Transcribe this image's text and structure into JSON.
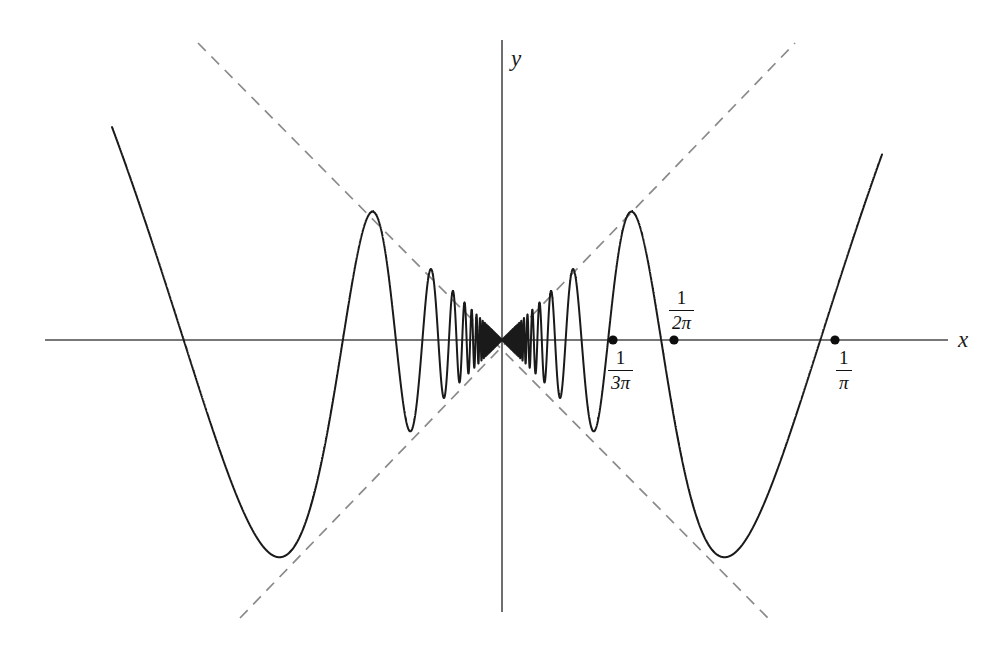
{
  "figure": {
    "title": "",
    "background_color": "#ffffff",
    "curve_color": "#1a1a1a",
    "envelope_color": "#8a8a8a",
    "axis_color": "#4a4a4a"
  },
  "axes": {
    "x_label": "x",
    "y_label": "y",
    "x_axis_pixel_y": 340,
    "y_axis_pixel_x": 502,
    "x_axis_start_px": 45,
    "x_axis_end_px": 948,
    "y_axis_top_px": 40,
    "y_axis_bottom_px": 612
  },
  "marked_roots": [
    {
      "label_num": "1",
      "label_den": "3π",
      "pixel_x": 613,
      "has_dot": true
    },
    {
      "label_num": "1",
      "label_den": "2π",
      "pixel_x": 674,
      "has_dot": true
    },
    {
      "label_num": "1",
      "label_den": "π",
      "pixel_x": 835,
      "has_dot": true
    }
  ],
  "chart_data": {
    "type": "line",
    "title": "",
    "xlabel": "x",
    "ylabel": "y",
    "function": "y = x sin(1/x)",
    "envelope_functions": [
      "y = x",
      "y = -x"
    ],
    "grid": false,
    "legend": false,
    "xlim": [
      -0.48,
      0.48
    ],
    "ylim": [
      -0.48,
      0.48
    ],
    "x_domain_drawn": [
      -0.39,
      0.38
    ],
    "annotations": [
      {
        "text": "1/(3π)",
        "x": 0.106,
        "y": 0
      },
      {
        "text": "1/(2π)",
        "x": 0.159,
        "y": 0
      },
      {
        "text": "1/π",
        "x": 0.318,
        "y": 0
      }
    ],
    "zero_crossings": [
      -0.318,
      -0.159,
      -0.106,
      -0.0796,
      -0.0637,
      -0.0531,
      -0.0455,
      -0.0398,
      -0.0354,
      -0.0318,
      -0.0289,
      -0.0265,
      -0.0245,
      -0.0227,
      -0.0212,
      -0.0199,
      0.0199,
      0.0212,
      0.0227,
      0.0245,
      0.0265,
      0.0289,
      0.0318,
      0.0354,
      0.0398,
      0.0455,
      0.0531,
      0.0637,
      0.0796,
      0.106,
      0.159,
      0.318
    ],
    "extrema_touching_envelope": [
      {
        "x": -0.2225,
        "y": 0.2225,
        "type": "max"
      },
      {
        "x": -0.1273,
        "y": -0.1273,
        "type": "min"
      },
      {
        "x": 0.1273,
        "y": 0.1273,
        "type": "max"
      },
      {
        "x": 0.2225,
        "y": -0.2225,
        "type": "min"
      }
    ]
  },
  "pixel_geometry": {
    "scale_px_per_unit": 1000,
    "curve_left_end_px": {
      "x": 134,
      "y": 188
    },
    "curve_right_end_px": {
      "x": 858,
      "y": 198
    },
    "envelope_up_left_px": {
      "x": 198,
      "y": 43
    },
    "envelope_up_right_px": {
      "x": 795,
      "y": 43
    },
    "envelope_down_left_px": {
      "x": 240,
      "y": 618
    },
    "envelope_down_right_px": {
      "x": 768,
      "y": 618
    }
  }
}
